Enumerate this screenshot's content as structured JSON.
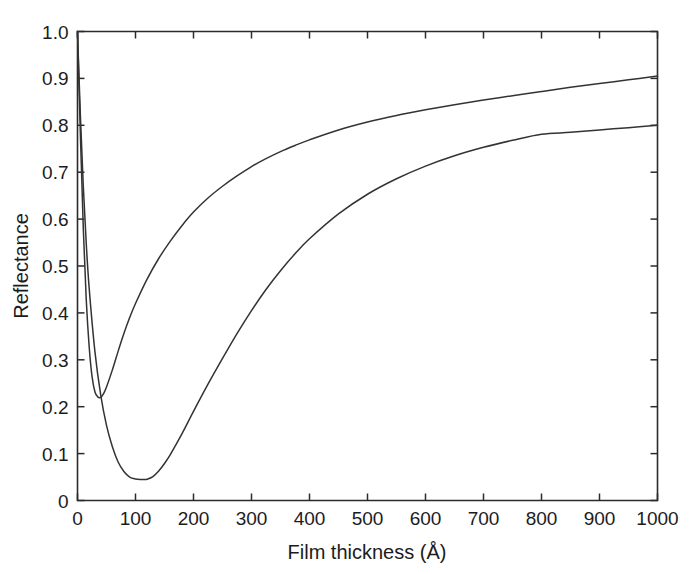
{
  "chart_data": {
    "type": "line",
    "title": "",
    "subtitle": "",
    "xlabel": "Film thickness (Å)",
    "ylabel": "Reflectance",
    "xlim": [
      0,
      1000
    ],
    "ylim": [
      0,
      1.0
    ],
    "xticks": [
      0,
      100,
      200,
      300,
      400,
      500,
      600,
      700,
      800,
      900,
      1000
    ],
    "xticklabels": [
      "0",
      "100",
      "200",
      "300",
      "400",
      "500",
      "600",
      "700",
      "800",
      "900",
      "1000"
    ],
    "yticks": [
      0,
      0.1,
      0.2,
      0.3,
      0.4,
      0.5,
      0.6,
      0.7,
      0.8,
      0.9,
      1.0
    ],
    "yticklabels": [
      "0",
      "0.1",
      "0.2",
      "0.3",
      "0.4",
      "0.5",
      "0.6",
      "0.7",
      "0.8",
      "0.9",
      "1.0"
    ],
    "grid": false,
    "legend": null,
    "annotations": [],
    "line_color": "#333333",
    "axis_color": "#2b2b2b",
    "background": "#ffffff",
    "series": [
      {
        "name": "upper-curve",
        "x": [
          0,
          5,
          10,
          15,
          20,
          25,
          30,
          35,
          40,
          45,
          50,
          60,
          70,
          80,
          90,
          100,
          120,
          140,
          160,
          180,
          200,
          225,
          250,
          275,
          300,
          325,
          350,
          375,
          400,
          450,
          500,
          550,
          600,
          650,
          700,
          750,
          800,
          850,
          900,
          950,
          1000
        ],
        "y": [
          1.0,
          0.78,
          0.58,
          0.43,
          0.33,
          0.265,
          0.232,
          0.221,
          0.22,
          0.228,
          0.242,
          0.278,
          0.318,
          0.356,
          0.39,
          0.42,
          0.472,
          0.516,
          0.553,
          0.586,
          0.615,
          0.645,
          0.67,
          0.692,
          0.712,
          0.729,
          0.744,
          0.757,
          0.769,
          0.79,
          0.807,
          0.821,
          0.833,
          0.844,
          0.854,
          0.863,
          0.872,
          0.881,
          0.889,
          0.897,
          0.905
        ]
      },
      {
        "name": "lower-curve",
        "x": [
          0,
          5,
          10,
          15,
          20,
          30,
          40,
          50,
          60,
          70,
          80,
          90,
          100,
          110,
          115,
          120,
          130,
          140,
          150,
          160,
          180,
          200,
          225,
          250,
          275,
          300,
          325,
          350,
          375,
          400,
          450,
          500,
          550,
          600,
          650,
          700,
          750,
          800,
          850,
          900,
          950,
          1000
        ],
        "y": [
          1.0,
          0.82,
          0.67,
          0.55,
          0.455,
          0.318,
          0.225,
          0.16,
          0.115,
          0.082,
          0.062,
          0.05,
          0.046,
          0.0448,
          0.0447,
          0.0452,
          0.051,
          0.063,
          0.079,
          0.098,
          0.142,
          0.19,
          0.248,
          0.303,
          0.356,
          0.405,
          0.45,
          0.49,
          0.526,
          0.558,
          0.611,
          0.653,
          0.686,
          0.713,
          0.735,
          0.753,
          0.768,
          0.781,
          0.785,
          0.79,
          0.795,
          0.8
        ]
      }
    ]
  }
}
